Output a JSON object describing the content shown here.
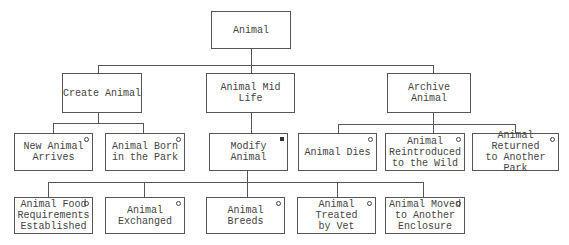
{
  "diagram": {
    "type": "hierarchy",
    "nodes": [
      {
        "id": "animal",
        "label": "Animal",
        "marker": "none",
        "box": [
          211,
          11,
          80,
          38
        ]
      },
      {
        "id": "create",
        "label": "Create Animal",
        "marker": "none",
        "box": [
          62,
          73,
          80,
          40
        ]
      },
      {
        "id": "midlife",
        "label": "Animal Mid Life",
        "marker": "none",
        "box": [
          206,
          73,
          89,
          40
        ]
      },
      {
        "id": "archive",
        "label": "Archive Animal",
        "marker": "none",
        "box": [
          387,
          73,
          84,
          40
        ]
      },
      {
        "id": "new_arrives",
        "label": "New Animal\nArrives",
        "marker": "circle",
        "box": [
          14,
          133,
          79,
          38
        ]
      },
      {
        "id": "born_park",
        "label": "Animal Born\nin the Park",
        "marker": "circle",
        "box": [
          105,
          133,
          80,
          38
        ]
      },
      {
        "id": "modify",
        "label": "Modify Animal",
        "marker": "square",
        "box": [
          209,
          133,
          79,
          38
        ]
      },
      {
        "id": "dies",
        "label": "Animal Dies",
        "marker": "circle",
        "box": [
          298,
          133,
          79,
          38
        ]
      },
      {
        "id": "reintroduced",
        "label": "Animal\nReintroduced\nto the Wild",
        "marker": "circle",
        "box": [
          385,
          133,
          80,
          38
        ]
      },
      {
        "id": "returned",
        "label": "Animal Returned\nto Another\nPark",
        "marker": "circle",
        "box": [
          472,
          133,
          87,
          38
        ]
      },
      {
        "id": "food_req",
        "label": "Animal Food\nRequirements\nEstablished",
        "marker": "circle",
        "box": [
          14,
          197,
          79,
          37
        ]
      },
      {
        "id": "exchanged",
        "label": "Animal\nExchanged",
        "marker": "circle",
        "box": [
          105,
          197,
          80,
          37
        ]
      },
      {
        "id": "breeds",
        "label": "Animal\nBreeds",
        "marker": "circle",
        "box": [
          206,
          197,
          79,
          37
        ]
      },
      {
        "id": "treated_vet",
        "label": "Animal Treated\nby Vet",
        "marker": "circle",
        "box": [
          297,
          197,
          79,
          37
        ]
      },
      {
        "id": "moved",
        "label": "Animal Moved\nto Another\nEnclosure",
        "marker": "circle",
        "box": [
          385,
          197,
          80,
          37
        ]
      }
    ],
    "edges": [
      [
        "animal",
        "create"
      ],
      [
        "animal",
        "midlife"
      ],
      [
        "animal",
        "archive"
      ],
      [
        "create",
        "new_arrives"
      ],
      [
        "create",
        "born_park"
      ],
      [
        "midlife",
        "modify"
      ],
      [
        "archive",
        "dies"
      ],
      [
        "archive",
        "reintroduced"
      ],
      [
        "archive",
        "returned"
      ],
      [
        "modify",
        "food_req"
      ],
      [
        "modify",
        "exchanged"
      ],
      [
        "modify",
        "breeds"
      ],
      [
        "modify",
        "treated_vet"
      ],
      [
        "modify",
        "moved"
      ]
    ],
    "line_color": "#555555"
  }
}
